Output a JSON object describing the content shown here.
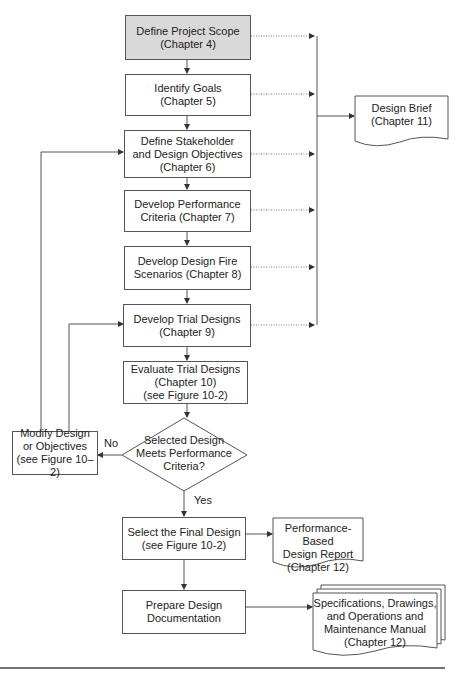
{
  "process_steps": [
    {
      "id": "scope",
      "lines": [
        "Define Project Scope",
        "(Chapter 4)"
      ]
    },
    {
      "id": "goals",
      "lines": [
        "Identify Goals",
        "(Chapter 5)"
      ]
    },
    {
      "id": "objectives",
      "lines": [
        "Define Stakeholder",
        "and Design Objectives",
        "(Chapter 6)"
      ]
    },
    {
      "id": "criteria",
      "lines": [
        "Develop Performance",
        "Criteria (Chapter 7)"
      ]
    },
    {
      "id": "scenarios",
      "lines": [
        "Develop Design Fire",
        "Scenarios (Chapter 8)"
      ]
    },
    {
      "id": "trial",
      "lines": [
        "Develop Trial Designs",
        "(Chapter 9)"
      ]
    },
    {
      "id": "evaluate",
      "lines": [
        "Evaluate Trial Designs",
        "(Chapter 10)",
        "(see Figure 10-2)"
      ]
    },
    {
      "id": "select",
      "lines": [
        "Select the Final Design",
        "(see Figure 10-2)"
      ]
    },
    {
      "id": "prepare",
      "lines": [
        "Prepare Design",
        "Documentation"
      ]
    }
  ],
  "decision": {
    "lines": [
      "Selected Design",
      "Meets Performance",
      "Criteria?"
    ],
    "yes_label": "Yes",
    "no_label": "No"
  },
  "modify": {
    "lines": [
      "Modify Design",
      "or Objectives",
      "(see Figure 10–2)"
    ]
  },
  "documents": {
    "brief": {
      "lines": [
        "Design Brief",
        "(Chapter 11)"
      ]
    },
    "report": {
      "lines": [
        "Performance-Based",
        "Design Report",
        "(Chapter 12)"
      ]
    },
    "manual": {
      "lines": [
        "Specifications, Drawings,",
        "and Operations and",
        "Maintenance Manual",
        "(Chapter 12)"
      ]
    }
  },
  "colors": {
    "start_fill": "#d9d9d9",
    "line": "#555555"
  }
}
